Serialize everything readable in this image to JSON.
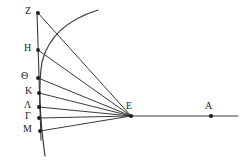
{
  "figure": {
    "kind": "geometric-optics-diagram",
    "width": 244,
    "height": 168,
    "background_color": "#ffffff",
    "stroke_color": "#3a3a3a",
    "point_color": "#1a1a1a"
  },
  "labels": {
    "Z": "Z",
    "H": "H",
    "Theta": "Θ",
    "Kappa": "K",
    "Lambda": "Λ",
    "Gamma": "Γ",
    "Mu": "M",
    "E": "E",
    "A": "A"
  },
  "points": [
    {
      "id": "Z",
      "label": "Z",
      "x": 38,
      "y": 13,
      "label_x": 25,
      "label_y": 6
    },
    {
      "id": "H",
      "label": "H",
      "x": 38,
      "y": 50,
      "label_x": 24,
      "label_y": 43
    },
    {
      "id": "Theta",
      "label": "Θ",
      "x": 38,
      "y": 78,
      "label_x": 21,
      "label_y": 71
    },
    {
      "id": "Kappa",
      "label": "K",
      "x": 39,
      "y": 93,
      "label_x": 25,
      "label_y": 86
    },
    {
      "id": "Lambda",
      "label": "Λ",
      "x": 39,
      "y": 107,
      "label_x": 24,
      "label_y": 100
    },
    {
      "id": "Gamma",
      "label": "Γ",
      "x": 39,
      "y": 118,
      "label_x": 25,
      "label_y": 111
    },
    {
      "id": "Mu",
      "label": "M",
      "x": 40,
      "y": 131,
      "label_x": 23,
      "label_y": 124
    },
    {
      "id": "E",
      "label": "E",
      "x": 131,
      "y": 116,
      "label_x": 126,
      "label_y": 101
    },
    {
      "id": "A",
      "label": "A",
      "x": 211,
      "y": 116,
      "label_x": 205,
      "label_y": 101
    }
  ],
  "segments": [
    {
      "name": "vertical-axis",
      "from": [
        37,
        12
      ],
      "to": [
        41,
        140
      ]
    },
    {
      "name": "horizontal-axis",
      "from": [
        131,
        116
      ],
      "to": [
        238,
        116
      ]
    },
    {
      "name": "ray-Z-E",
      "from": [
        38,
        13
      ],
      "to": [
        131,
        116
      ]
    },
    {
      "name": "ray-H-E",
      "from": [
        38,
        50
      ],
      "to": [
        131,
        116
      ]
    },
    {
      "name": "ray-Theta-E",
      "from": [
        38,
        78
      ],
      "to": [
        131,
        116
      ]
    },
    {
      "name": "ray-Kappa-E",
      "from": [
        39,
        93
      ],
      "to": [
        131,
        116
      ]
    },
    {
      "name": "ray-Lambda-E",
      "from": [
        39,
        107
      ],
      "to": [
        131,
        116
      ]
    },
    {
      "name": "ray-Gamma-E",
      "from": [
        39,
        118
      ],
      "to": [
        131,
        116
      ]
    },
    {
      "name": "ray-Mu-E",
      "from": [
        40,
        131
      ],
      "to": [
        131,
        116
      ]
    }
  ],
  "curves": [
    {
      "name": "main-arc",
      "description": "arc passing near the labelled points, rising to the upper right",
      "path": "M 45,156 C 40,120 38,86 42,62 C 48,38 66,20 98,10"
    }
  ]
}
